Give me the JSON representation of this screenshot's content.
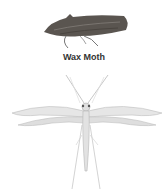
{
  "figures": [
    {
      "label": "Wax Moth",
      "description": "dark brown moth side view"
    },
    {
      "label": "",
      "description": "pale plume moth, wings spread"
    }
  ],
  "colors": {
    "background": "#ffffff",
    "wax_moth": "#5a5550",
    "plume_moth": "#c8c8c8",
    "caption": "#333333"
  }
}
